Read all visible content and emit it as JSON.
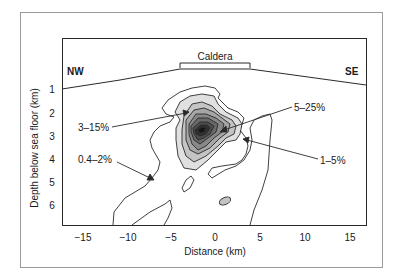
{
  "figure": {
    "frame_color": "#9a9a9a",
    "line_color": "#2a2a2a",
    "x_axis": {
      "label": "Distance (km)",
      "ticks": [
        "−15",
        "−10",
        "−5",
        "0",
        "5",
        "10",
        "15"
      ]
    },
    "y_axis": {
      "label": "Depth below sea floor (km)",
      "ticks": [
        "1",
        "2",
        "3",
        "4",
        "5",
        "6"
      ]
    },
    "direction_left": "NW",
    "direction_right": "SE",
    "caldera_label": "Caldera",
    "annotations": [
      {
        "text": "3–15%"
      },
      {
        "text": "5–25%"
      },
      {
        "text": "1–5%"
      },
      {
        "text": "0.4–2%"
      }
    ],
    "contour_fills": [
      "#e0e0e0",
      "#c4c4c4",
      "#a6a6a6",
      "#888888",
      "#6a6a6a",
      "#4c4c4c",
      "#303030",
      "#151515"
    ]
  }
}
